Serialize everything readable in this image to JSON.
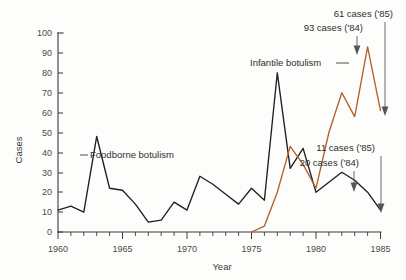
{
  "chart_data": {
    "type": "line",
    "title": "",
    "xlabel": "Year",
    "ylabel": "Cases",
    "xlim": [
      1960,
      1985
    ],
    "ylim": [
      0,
      100
    ],
    "grid": false,
    "legend_position": "inline-labels",
    "x": [
      1960,
      1961,
      1962,
      1963,
      1964,
      1965,
      1966,
      1967,
      1968,
      1969,
      1970,
      1971,
      1972,
      1973,
      1974,
      1975,
      1976,
      1977,
      1978,
      1979,
      1980,
      1981,
      1982,
      1983,
      1984,
      1985
    ],
    "xticks": [
      1960,
      1965,
      1970,
      1975,
      1980,
      1985
    ],
    "xticklabels": [
      "1960",
      "1965",
      "1970",
      "1975",
      "1980",
      "1985"
    ],
    "yticks": [
      0,
      10,
      20,
      30,
      40,
      50,
      60,
      70,
      80,
      90,
      100
    ],
    "yticklabels": [
      "0",
      "10",
      "20",
      "30",
      "40",
      "50",
      "60",
      "70",
      "80",
      "90",
      "100"
    ],
    "series": [
      {
        "name": "Foodborne botulism",
        "color": "#1f1f24",
        "x": [
          1960,
          1961,
          1962,
          1963,
          1964,
          1965,
          1966,
          1967,
          1968,
          1969,
          1970,
          1971,
          1972,
          1973,
          1974,
          1975,
          1976,
          1977,
          1978,
          1979,
          1980,
          1981,
          1982,
          1983,
          1984,
          1985
        ],
        "values": [
          11,
          13,
          10,
          48,
          22,
          21,
          14,
          5,
          6,
          15,
          11,
          28,
          24,
          19,
          14,
          22,
          16,
          80,
          32,
          42,
          20,
          25,
          30,
          26,
          20,
          11
        ]
      },
      {
        "name": "Infantile botulism",
        "color": "#b5602a",
        "x": [
          1975,
          1976,
          1977,
          1978,
          1979,
          1980,
          1981,
          1982,
          1983,
          1984,
          1985
        ],
        "values": [
          0,
          3,
          20,
          43,
          34,
          22,
          50,
          70,
          58,
          93,
          61
        ]
      }
    ],
    "annotations": [
      {
        "text": "61 cases ('85)",
        "target_x": 1985,
        "target_y": 61
      },
      {
        "text": "93 cases ('84)",
        "target_x": 1984,
        "target_y": 93
      },
      {
        "text": "11 cases ('85)",
        "target_x": 1985,
        "target_y": 11
      },
      {
        "text": "20 cases ('84)",
        "target_x": 1984,
        "target_y": 20
      }
    ],
    "series_labels": [
      {
        "text": "Foodborne botulism",
        "points_to": "Foodborne botulism"
      },
      {
        "text": "Infantile botulism",
        "points_to": "Infantile botulism"
      }
    ]
  },
  "axes": {
    "y_title": "Cases",
    "x_title": "Year"
  },
  "colors": {
    "foodborne": "#1f1f24",
    "infantile": "#b5602a",
    "axis": "#3a3a3a",
    "annotation_arrow": "#55555f",
    "background": "#fdfdfb"
  },
  "labels": {
    "foodborne_series": "Foodborne botulism",
    "infantile_series": "Infantile botulism",
    "anno_61": "61 cases ('85)",
    "anno_93": "93 cases ('84)",
    "anno_11": "11 cases ('85)",
    "anno_20": "20 cases ('84)"
  },
  "yticks": {
    "t0": "0",
    "t10": "10",
    "t20": "20",
    "t30": "30",
    "t40": "40",
    "t50": "50",
    "t60": "60",
    "t70": "70",
    "t80": "80",
    "t90": "90",
    "t100": "100"
  },
  "xticks": {
    "t1960": "1960",
    "t1965": "1965",
    "t1970": "1970",
    "t1975": "1975",
    "t1980": "1980",
    "t1985": "1985"
  }
}
